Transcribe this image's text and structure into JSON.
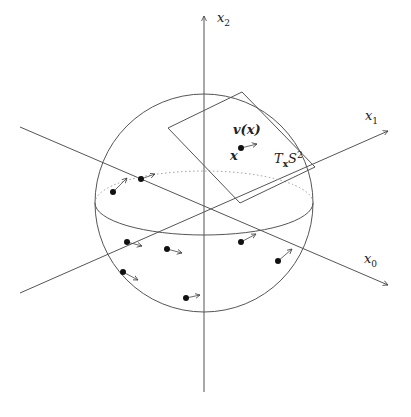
{
  "diagram": {
    "axes": [
      {
        "name": "x0",
        "label": "x",
        "sub": "0"
      },
      {
        "name": "x1",
        "label": "x",
        "sub": "1"
      },
      {
        "name": "x2",
        "label": "x",
        "sub": "2"
      }
    ],
    "labels": {
      "vector": "v(x)",
      "point": "x",
      "tangent_plane_main": "T",
      "tangent_plane_sub": "x",
      "tangent_plane_space": "S",
      "tangent_plane_sup": "2"
    },
    "colors": {
      "line": "#555555",
      "dot": "#111111",
      "dotted": "#999999"
    },
    "sphere": {
      "cx": 204,
      "cy": 203,
      "r": 109,
      "equator_ry": 32
    },
    "points": [
      {
        "x": 241,
        "y": 148,
        "ax": 257,
        "ay": 144
      },
      {
        "x": 113,
        "y": 192,
        "ax": 127,
        "ay": 178
      },
      {
        "x": 141,
        "y": 179,
        "ax": 155,
        "ay": 174
      },
      {
        "x": 127,
        "y": 242,
        "ax": 142,
        "ay": 246
      },
      {
        "x": 167,
        "y": 249,
        "ax": 182,
        "ay": 253
      },
      {
        "x": 123,
        "y": 272,
        "ax": 138,
        "ay": 280
      },
      {
        "x": 186,
        "y": 298,
        "ax": 200,
        "ay": 295
      },
      {
        "x": 241,
        "y": 242,
        "ax": 256,
        "ay": 234
      },
      {
        "x": 278,
        "y": 261,
        "ax": 292,
        "ay": 249
      }
    ]
  }
}
